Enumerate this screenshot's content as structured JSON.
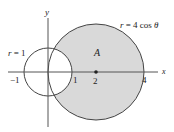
{
  "diagram": {
    "type": "polar-region",
    "axes": {
      "x_label": "x",
      "y_label": "y"
    },
    "curves": [
      {
        "equation": "r = 1",
        "type": "circle",
        "center": [
          0,
          0
        ],
        "radius": 1
      },
      {
        "equation": "r = 4 cos θ",
        "type": "circle",
        "center": [
          2,
          0
        ],
        "radius": 2,
        "shaded": true
      }
    ],
    "region_label": "A",
    "tick_labels": [
      "−1",
      "1",
      "2",
      "4"
    ],
    "point": {
      "x": 2,
      "y": 0
    },
    "colors": {
      "shade": "#d9d9d9",
      "stroke": "#444444",
      "axis": "#555555"
    }
  },
  "labels": {
    "y_axis": "y",
    "x_axis": "x",
    "small_circle_r": "r",
    "small_circle_eq": " = 1",
    "big_circle_r": "r",
    "big_circle_eq": " = 4 cos ",
    "big_circle_theta": "θ",
    "region": "A",
    "tick_neg1": "−1",
    "tick_1": "1",
    "tick_2": "2",
    "tick_4": "4"
  }
}
